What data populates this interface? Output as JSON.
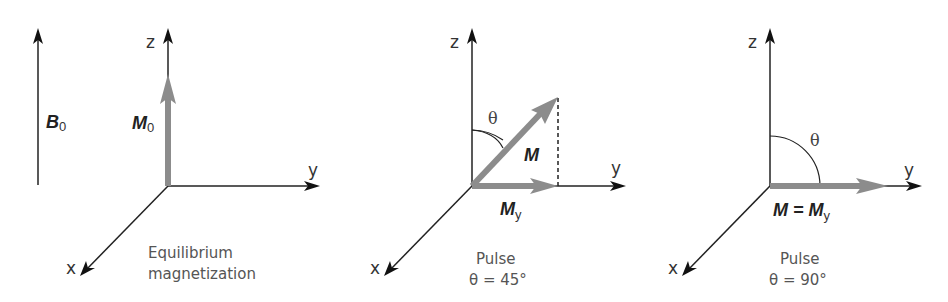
{
  "figure": {
    "colors": {
      "axis": "#222222",
      "vector": "#8c8c8c",
      "text": "#333333",
      "caption": "#555555"
    },
    "field": {
      "label": "B",
      "subscript": "0"
    },
    "panels": [
      {
        "id": "equilibrium",
        "axes": {
          "z": "z",
          "y": "y",
          "x": "x"
        },
        "vector": {
          "label": "M",
          "subscript": "0"
        },
        "caption_line1": "Equilibrium",
        "caption_line2": "magnetization"
      },
      {
        "id": "pulse-45",
        "axes": {
          "z": "z",
          "y": "y",
          "x": "x"
        },
        "angle_symbol": "θ",
        "vector": {
          "label": "M"
        },
        "component": {
          "label": "M",
          "subscript": "y"
        },
        "caption_line1": "Pulse",
        "caption_line2": "θ  = 45°"
      },
      {
        "id": "pulse-90",
        "axes": {
          "z": "z",
          "y": "y",
          "x": "x"
        },
        "angle_symbol": "θ",
        "vector": {
          "label": "M = M",
          "subscript": "y"
        },
        "caption_line1": "Pulse",
        "caption_line2": "θ  = 90°"
      }
    ]
  }
}
